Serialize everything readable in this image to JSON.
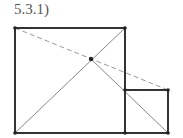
{
  "label": "5.3.1)",
  "colors": {
    "thick": "#333333",
    "thin": "#777777",
    "dashed": "#888888",
    "point": "#222222"
  },
  "big_square": {
    "x1": 15,
    "y1": 28,
    "x2": 125,
    "y2": 133
  },
  "small_square": {
    "x1": 125,
    "y1": 90,
    "x2": 168,
    "y2": 133
  },
  "intersection": {
    "x": 91,
    "y": 59
  }
}
